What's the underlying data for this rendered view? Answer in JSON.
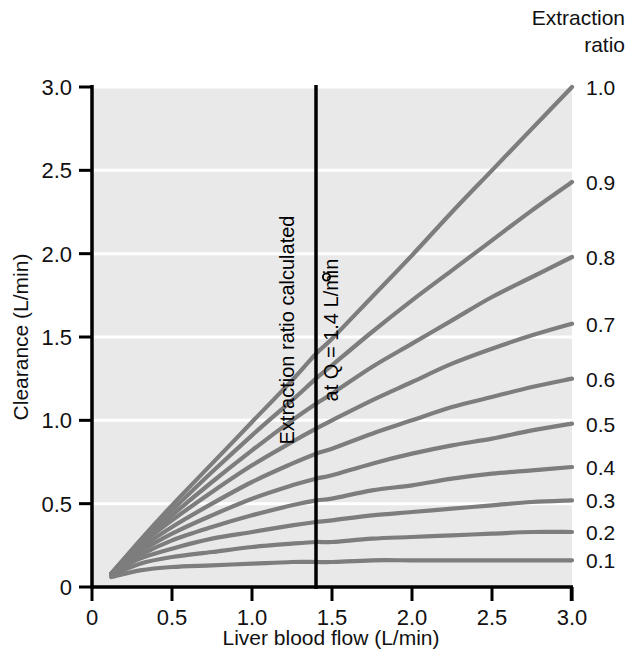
{
  "chart_data": {
    "type": "line",
    "title": "",
    "xlabel": "Liver blood flow (L/min)",
    "ylabel": "Clearance (L/min)",
    "xlim": [
      0,
      3.0
    ],
    "ylim": [
      0,
      3.0
    ],
    "xticks": [
      "0",
      "0.5",
      "1.0",
      "1.5",
      "2.0",
      "2.5",
      "3.0"
    ],
    "xtick_values": [
      0,
      0.5,
      1.0,
      1.5,
      2.0,
      2.5,
      3.0
    ],
    "yticks": [
      "0",
      "0.5",
      "1.0",
      "1.5",
      "2.0",
      "2.5",
      "3.0"
    ],
    "ytick_values": [
      0,
      0.5,
      1.0,
      1.5,
      2.0,
      2.5,
      3.0
    ],
    "grid": "horizontal-white-gridlines",
    "plot_background": "#e9e9e9",
    "curve_color": "#7d7d7d",
    "legend_position": "right-of-plot, one label per curve",
    "legend_title_line1": "Extraction",
    "legend_title_line2": "ratio",
    "annotation_line1": "Extraction ratio calculated",
    "annotation_line2": "at Q̊ = 1.4 L/min",
    "annotation_x_value": 1.4,
    "reference_line": {
      "orientation": "vertical",
      "x": 1.4,
      "color": "#000000"
    },
    "curve_origin": {
      "x": 0.12,
      "y": 0.08
    },
    "series": [
      {
        "name": "1.0",
        "extraction_ratio": 1.0,
        "x": [
          0.12,
          0.3,
          0.5,
          0.75,
          1.0,
          1.25,
          1.4,
          1.5,
          1.75,
          2.0,
          2.25,
          2.5,
          2.75,
          3.0
        ],
        "values": [
          0.08,
          0.28,
          0.49,
          0.74,
          0.99,
          1.24,
          1.4,
          1.49,
          1.74,
          1.99,
          2.25,
          2.5,
          2.75,
          3.0
        ]
      },
      {
        "name": "0.9",
        "extraction_ratio": 0.9,
        "x": [
          0.12,
          0.3,
          0.5,
          0.75,
          1.0,
          1.25,
          1.4,
          1.5,
          1.75,
          2.0,
          2.25,
          2.5,
          2.75,
          3.0
        ],
        "values": [
          0.08,
          0.27,
          0.46,
          0.69,
          0.91,
          1.12,
          1.25,
          1.33,
          1.53,
          1.72,
          1.9,
          2.08,
          2.26,
          2.43
        ]
      },
      {
        "name": "0.8",
        "extraction_ratio": 0.8,
        "x": [
          0.12,
          0.3,
          0.5,
          0.75,
          1.0,
          1.25,
          1.4,
          1.5,
          1.75,
          2.0,
          2.25,
          2.5,
          2.75,
          3.0
        ],
        "values": [
          0.08,
          0.26,
          0.43,
          0.63,
          0.82,
          1.0,
          1.1,
          1.16,
          1.32,
          1.46,
          1.6,
          1.74,
          1.86,
          1.98
        ]
      },
      {
        "name": "0.7",
        "extraction_ratio": 0.7,
        "x": [
          0.12,
          0.3,
          0.5,
          0.75,
          1.0,
          1.25,
          1.4,
          1.5,
          1.75,
          2.0,
          2.25,
          2.5,
          2.75,
          3.0
        ],
        "values": [
          0.08,
          0.25,
          0.4,
          0.57,
          0.73,
          0.87,
          0.95,
          1.0,
          1.12,
          1.23,
          1.34,
          1.43,
          1.51,
          1.58
        ]
      },
      {
        "name": "0.6",
        "extraction_ratio": 0.6,
        "x": [
          0.12,
          0.3,
          0.5,
          0.75,
          1.0,
          1.25,
          1.4,
          1.5,
          1.75,
          2.0,
          2.25,
          2.5,
          2.75,
          3.0
        ],
        "values": [
          0.08,
          0.23,
          0.36,
          0.5,
          0.63,
          0.74,
          0.8,
          0.83,
          0.92,
          1.0,
          1.08,
          1.14,
          1.2,
          1.25
        ]
      },
      {
        "name": "0.5",
        "extraction_ratio": 0.5,
        "x": [
          0.12,
          0.3,
          0.5,
          0.75,
          1.0,
          1.25,
          1.4,
          1.5,
          1.75,
          2.0,
          2.25,
          2.5,
          2.75,
          3.0
        ],
        "values": [
          0.08,
          0.21,
          0.32,
          0.43,
          0.53,
          0.61,
          0.65,
          0.67,
          0.74,
          0.8,
          0.85,
          0.89,
          0.94,
          0.98
        ]
      },
      {
        "name": "0.4",
        "extraction_ratio": 0.4,
        "x": [
          0.12,
          0.3,
          0.5,
          0.75,
          1.0,
          1.25,
          1.4,
          1.5,
          1.75,
          2.0,
          2.25,
          2.5,
          2.75,
          3.0
        ],
        "values": [
          0.08,
          0.19,
          0.28,
          0.36,
          0.43,
          0.49,
          0.52,
          0.53,
          0.58,
          0.61,
          0.65,
          0.68,
          0.7,
          0.72
        ]
      },
      {
        "name": "0.3",
        "extraction_ratio": 0.3,
        "x": [
          0.12,
          0.3,
          0.5,
          0.75,
          1.0,
          1.25,
          1.4,
          1.5,
          1.75,
          2.0,
          2.25,
          2.5,
          2.75,
          3.0
        ],
        "values": [
          0.08,
          0.17,
          0.23,
          0.29,
          0.33,
          0.37,
          0.39,
          0.4,
          0.43,
          0.45,
          0.47,
          0.49,
          0.51,
          0.52
        ]
      },
      {
        "name": "0.2",
        "extraction_ratio": 0.2,
        "x": [
          0.12,
          0.3,
          0.5,
          0.75,
          1.0,
          1.25,
          1.4,
          1.5,
          1.75,
          2.0,
          2.25,
          2.5,
          2.75,
          3.0
        ],
        "values": [
          0.07,
          0.14,
          0.18,
          0.21,
          0.24,
          0.26,
          0.27,
          0.27,
          0.29,
          0.3,
          0.31,
          0.32,
          0.33,
          0.33
        ]
      },
      {
        "name": "0.1",
        "extraction_ratio": 0.1,
        "x": [
          0.12,
          0.3,
          0.5,
          0.75,
          1.0,
          1.25,
          1.4,
          1.5,
          1.75,
          2.0,
          2.25,
          2.5,
          2.75,
          3.0
        ],
        "values": [
          0.06,
          0.1,
          0.12,
          0.13,
          0.14,
          0.15,
          0.15,
          0.15,
          0.16,
          0.16,
          0.16,
          0.16,
          0.16,
          0.16
        ]
      }
    ]
  },
  "legend": {
    "title_line1": "Extraction",
    "title_line2": "ratio",
    "labels": [
      "1.0",
      "0.9",
      "0.8",
      "0.7",
      "0.6",
      "0.5",
      "0.4",
      "0.3",
      "0.2",
      "0.1"
    ]
  },
  "axes": {
    "x_title": "Liver blood flow (L/min)",
    "y_title": "Clearance (L/min)",
    "x_ticks": [
      "0",
      "0.5",
      "1.0",
      "1.5",
      "2.0",
      "2.5",
      "3.0"
    ],
    "y_ticks": [
      "3.0",
      "2.5",
      "2.0",
      "1.5",
      "1.0",
      "0.5",
      "0"
    ]
  },
  "annotation": {
    "line1": "Extraction ratio calculated",
    "line2_prefix": "at ",
    "line2_symbol": "Q",
    "line2_suffix": " = 1.4 L/min"
  },
  "colors": {
    "plot_bg": "#e9e9e9",
    "gridline": "#ffffff",
    "curve": "#7d7d7d",
    "axis": "#000000",
    "text": "#111111"
  }
}
